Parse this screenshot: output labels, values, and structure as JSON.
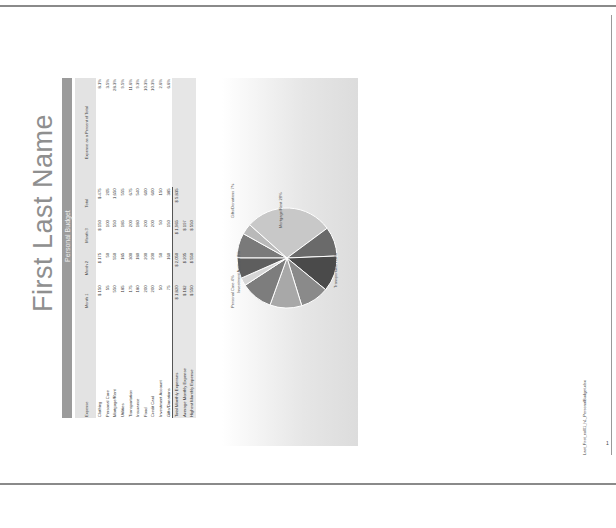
{
  "page": {
    "title": "First Last Name",
    "subtitle": "Personal Budget",
    "footer_filename": "Last_First_exl01_h1_PersonalBudget.xlsx",
    "page_number": "1"
  },
  "table": {
    "headers": [
      "Expense",
      "Month 1",
      "Month 2",
      "Month 3",
      "Total",
      "Expense as a Percent of Total"
    ],
    "rows": [
      {
        "label": "Clothing",
        "m1": "$ 150",
        "m2": "$ 175",
        "m3": "$ 150",
        "total": "$ 475",
        "pct": "8.1%"
      },
      {
        "label": "Personal Care",
        "m1": "55",
        "m2": "50",
        "m3": "100",
        "total": "205",
        "pct": "3.5%"
      },
      {
        "label": "Mortgage/Rent",
        "m1": "550",
        "m2": "550",
        "m3": "550",
        "total": "1,650",
        "pct": "28.3%"
      },
      {
        "label": "Utilities",
        "m1": "185",
        "m2": "185",
        "m3": "185",
        "total": "555",
        "pct": "9.5%"
      },
      {
        "label": "Transportation",
        "m1": "175",
        "m2": "300",
        "m3": "200",
        "total": "675",
        "pct": "11.6%"
      },
      {
        "label": "Insurance",
        "m1": "180",
        "m2": "180",
        "m3": "180",
        "total": "540",
        "pct": "9.3%"
      },
      {
        "label": "Food",
        "m1": "200",
        "m2": "200",
        "m3": "200",
        "total": "600",
        "pct": "10.3%"
      },
      {
        "label": "Credit Card",
        "m1": "200",
        "m2": "200",
        "m3": "200",
        "total": "600",
        "pct": "10.3%"
      },
      {
        "label": "Investment Account",
        "m1": "50",
        "m2": "50",
        "m3": "50",
        "total": "150",
        "pct": "2.6%"
      },
      {
        "label": "Gifts/Donations",
        "m1": "75",
        "m2": "160",
        "m3": "150",
        "total": "385",
        "pct": "6.6%"
      }
    ],
    "summary": [
      {
        "label": "Total Monthly Expenses",
        "m1": "$ 1,820",
        "m2": "$ 2,050",
        "m3": "$ 1,965",
        "total": "$ 5,835"
      },
      {
        "label": "Average Monthly Expense",
        "m1": "$ 182",
        "m2": "$ 205",
        "m3": "$ 197",
        "total": ""
      },
      {
        "label": "Highest Monthly Expense",
        "m1": "$ 550",
        "m2": "$ 550",
        "m3": "$ 550",
        "total": ""
      }
    ]
  },
  "chart_data": {
    "type": "pie",
    "title": "",
    "categories": [
      "Clothing",
      "Personal Care",
      "Mortgage/Rent",
      "Utilities",
      "Transportation",
      "Insurance",
      "Food",
      "Credit Card",
      "Investment Account",
      "Gifts/Donations"
    ],
    "values": [
      8.1,
      3.5,
      28.3,
      9.5,
      11.6,
      9.3,
      10.3,
      10.3,
      2.6,
      6.6
    ],
    "labels_visible": [
      "Mortgage/Rent 28%",
      "Transportation 12%",
      "Personal Care 4%",
      "Investment Account 3%",
      "Gifts/Donations 7%"
    ],
    "colors": [
      "#7a7a7a",
      "#b9b9b9",
      "#c8c8c8",
      "#6a6a6a",
      "#4a4a4a",
      "#8a8a8a",
      "#a8a8a8",
      "#7d7d7d",
      "#d6d6d6",
      "#5e5e5e"
    ]
  }
}
